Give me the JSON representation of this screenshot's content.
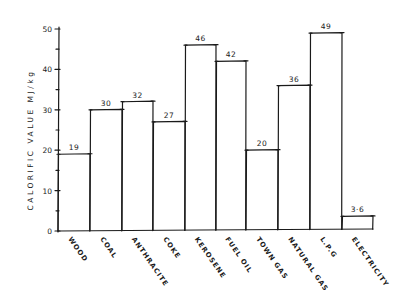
{
  "chart_data": {
    "type": "bar",
    "title": "",
    "xlabel": "",
    "ylabel": "CALORIFIC VALUE  MJ/kg",
    "ylim": [
      0,
      50
    ],
    "yticks": [
      0,
      10,
      20,
      30,
      40,
      50
    ],
    "grid": false,
    "legend": null,
    "categories": [
      "WOOD",
      "COAL",
      "ANTHRACITE",
      "COKE",
      "KEROSENE",
      "FUEL OIL",
      "TOWN GAS",
      "NATURAL GAS",
      "L.P.G",
      "ELECTRICITY"
    ],
    "values": [
      19,
      30,
      32,
      27,
      46,
      42,
      20,
      36,
      49,
      3.6
    ],
    "value_labels": [
      "19",
      "30",
      "32",
      "27",
      "46",
      "42",
      "20",
      "36",
      "49",
      "3·6"
    ],
    "style": "hand-drawn, black ink on white, adjacent bars with no gaps"
  }
}
